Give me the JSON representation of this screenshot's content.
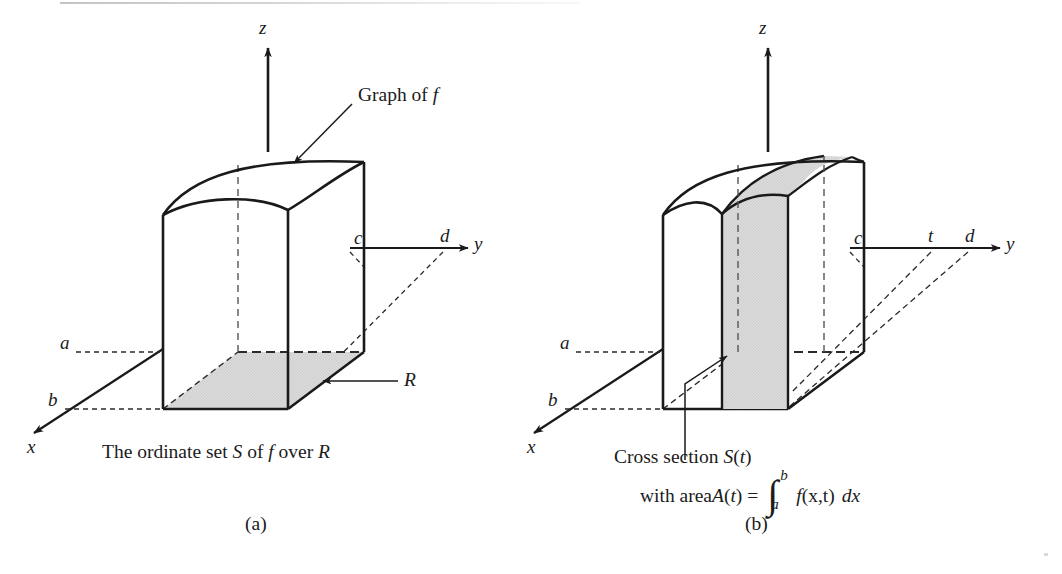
{
  "figure": {
    "title_text": "",
    "background_color": "#ffffff",
    "ink_color": "#1a1a1a",
    "shade_color": "#d9d9d9"
  },
  "panel_a": {
    "caption": "(a)",
    "description": "The ordinate set S of f over R",
    "description_parts": {
      "t1": "The ordinate set ",
      "S": "S",
      "t2": " of ",
      "f": "f",
      "t3": " over ",
      "R": "R"
    },
    "axes": [
      {
        "name": "z-axis",
        "label": "z"
      },
      {
        "name": "y-axis",
        "label": "y"
      },
      {
        "name": "x-axis",
        "label": "x"
      }
    ],
    "tick_labels": [
      {
        "name": "tick-a",
        "label": "a",
        "axis": "x"
      },
      {
        "name": "tick-b",
        "label": "b",
        "axis": "x"
      },
      {
        "name": "tick-c",
        "label": "c",
        "axis": "y"
      },
      {
        "name": "tick-d",
        "label": "d",
        "axis": "y"
      }
    ],
    "annotations": [
      {
        "name": "graph-of-f",
        "text_plain": "Graph of f",
        "t1": "Graph of ",
        "f": "f"
      },
      {
        "name": "region-R",
        "text_plain": "R"
      }
    ]
  },
  "panel_b": {
    "caption": "(b)",
    "axes": [
      {
        "name": "z-axis",
        "label": "z"
      },
      {
        "name": "y-axis",
        "label": "y"
      },
      {
        "name": "x-axis",
        "label": "x"
      }
    ],
    "tick_labels": [
      {
        "name": "tick-a",
        "label": "a",
        "axis": "x"
      },
      {
        "name": "tick-b",
        "label": "b",
        "axis": "x"
      },
      {
        "name": "tick-c",
        "label": "c",
        "axis": "y"
      },
      {
        "name": "tick-t",
        "label": "t",
        "axis": "y"
      },
      {
        "name": "tick-d",
        "label": "d",
        "axis": "y"
      }
    ],
    "annotations": [
      {
        "name": "cross-section-label",
        "line1_plain": "Cross section S(t)",
        "line1_t1": "Cross section ",
        "line1_S": "S",
        "line1_paren1": "(",
        "line1_t": "t",
        "line1_paren2": ")",
        "line2_plain": "with area A(t) =",
        "line2_t1": "with area ",
        "line2_A": "A",
        "line2_paren1": "(",
        "line2_t": "t",
        "line2_paren2": ") =",
        "integral_symbol": "∫",
        "integral_upper": "b",
        "integral_lower": "a",
        "integrand_f": "f",
        "integrand_args": "(x,t)",
        "integrand_dx": "dx",
        "formula_plain": "A(t) = ∫_a^b f(x,t) dx"
      }
    ]
  }
}
